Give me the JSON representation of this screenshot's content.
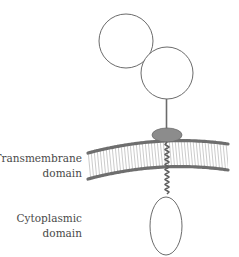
{
  "diagram": {
    "type": "receptor-schematic",
    "labels": {
      "transmembrane": {
        "line1": "Transmembrane",
        "line2": "domain"
      },
      "cytoplasmic": {
        "line1": "Cytoplasmic",
        "line2": "domain"
      }
    },
    "colors": {
      "outline": "#6b6b6b",
      "membrane_head": "#6e6e6e",
      "membrane_tail": "#b5b5b5",
      "anchor_fill": "#8c8c8c",
      "text": "#4a4a4a"
    },
    "shapes": {
      "extracellular_domain_1": {
        "cx": 126,
        "cy": 41,
        "r": 27
      },
      "extracellular_domain_2": {
        "cx": 167,
        "cy": 73,
        "r": 26
      },
      "stalk": {
        "x": 166,
        "y1": 99,
        "y2": 129
      },
      "membrane_anchor": {
        "cx": 167,
        "cy": 135,
        "rx": 15,
        "ry": 7
      },
      "cytoplasmic_domain": {
        "cx": 166,
        "cy": 226,
        "rx": 16,
        "ry": 29
      }
    }
  }
}
